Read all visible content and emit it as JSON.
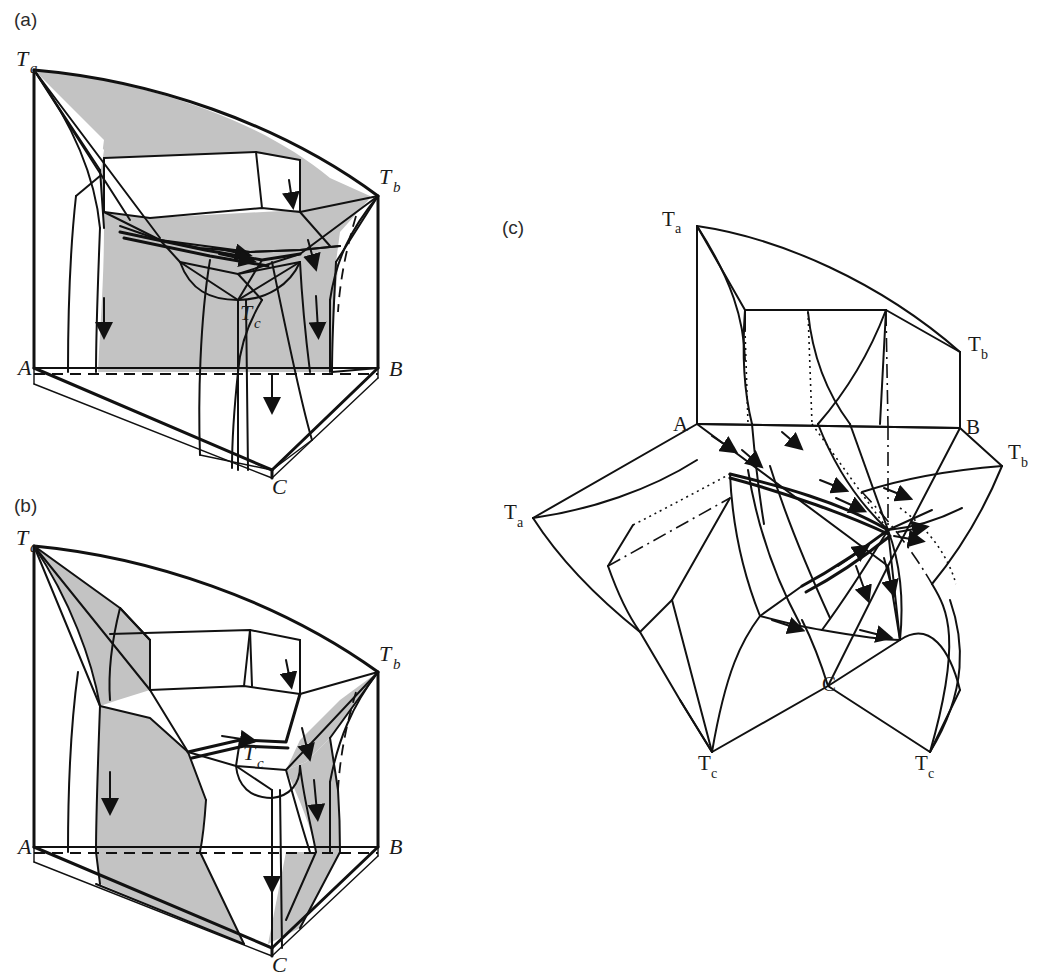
{
  "figure": {
    "kind": "ternary-eutectic-phase-diagram-3d",
    "background": "#ffffff",
    "ink_color": "#111111",
    "shade_color": "#c3c3c3",
    "panel_count": 3
  },
  "panels": [
    {
      "id": "a",
      "label": "(a)",
      "label_pos": {
        "x": 14,
        "y": 26
      },
      "description": "Three-dimensional ternary liquidus surface prism, front faces shaded",
      "vertices": [
        {
          "name": "Ta",
          "base": "T",
          "sub": "a",
          "style": "italic",
          "x": 16,
          "y": 66
        },
        {
          "name": "Tb",
          "base": "T",
          "sub": "b",
          "style": "italic",
          "x": 379,
          "y": 184
        },
        {
          "name": "Tc",
          "base": "T",
          "sub": "c",
          "style": "italic",
          "x": 240,
          "y": 320
        },
        {
          "name": "A",
          "base": "A",
          "sub": "",
          "style": "italic",
          "x": 22,
          "y": 368
        },
        {
          "name": "B",
          "base": "B",
          "sub": "",
          "style": "italic",
          "x": 389,
          "y": 370
        },
        {
          "name": "C",
          "base": "C",
          "sub": "",
          "style": "italic",
          "x": 272,
          "y": 490
        }
      ]
    },
    {
      "id": "b",
      "label": "(b)",
      "label_pos": {
        "x": 14,
        "y": 512
      },
      "description": "Same prism with the two-phase surfaces drawn separated, shaded",
      "vertices": [
        {
          "name": "Ta",
          "base": "T",
          "sub": "a",
          "style": "italic",
          "x": 16,
          "y": 545
        },
        {
          "name": "Tb",
          "base": "T",
          "sub": "b",
          "style": "italic",
          "x": 379,
          "y": 666
        },
        {
          "name": "Tc",
          "base": "T",
          "sub": "c",
          "style": "italic",
          "x": 243,
          "y": 760
        },
        {
          "name": "A",
          "base": "A",
          "sub": "",
          "style": "italic",
          "x": 22,
          "y": 847
        },
        {
          "name": "B",
          "base": "B",
          "sub": "",
          "style": "italic",
          "x": 389,
          "y": 847
        },
        {
          "name": "C",
          "base": "C",
          "sub": "",
          "style": "italic",
          "x": 272,
          "y": 968
        }
      ]
    },
    {
      "id": "c",
      "label": "(c)",
      "label_pos": {
        "x": 502,
        "y": 230
      },
      "description": "Exploded / unfolded view of the three binary liquidus wings and the ternary surface, line drawing only",
      "vertices": [
        {
          "name": "Ta-top",
          "base": "T",
          "sub": "a",
          "style": "roman",
          "x": 668,
          "y": 226
        },
        {
          "name": "Tb-top",
          "base": "T",
          "sub": "b",
          "style": "roman",
          "x": 974,
          "y": 351
        },
        {
          "name": "A",
          "base": "A",
          "sub": "",
          "style": "roman",
          "x": 677,
          "y": 436
        },
        {
          "name": "B",
          "base": "B",
          "sub": "",
          "style": "roman",
          "x": 987,
          "y": 437
        },
        {
          "name": "Tb-right",
          "base": "T",
          "sub": "b",
          "style": "roman",
          "x": 1014,
          "y": 459
        },
        {
          "name": "Ta-left",
          "base": "T",
          "sub": "a",
          "style": "roman",
          "x": 510,
          "y": 519
        },
        {
          "name": "C",
          "base": "C",
          "sub": "",
          "style": "roman",
          "x": 828,
          "y": 691
        },
        {
          "name": "Tc-left",
          "base": "T",
          "sub": "c",
          "style": "roman",
          "x": 706,
          "y": 766
        },
        {
          "name": "Tc-right",
          "base": "T",
          "sub": "c",
          "style": "roman",
          "x": 923,
          "y": 766
        }
      ]
    }
  ],
  "legend_note": {
    "arrows_meaning": "falling temperature direction along univariant valleys",
    "shaded_meaning": "liquidus / solidus surface shown shaded"
  }
}
